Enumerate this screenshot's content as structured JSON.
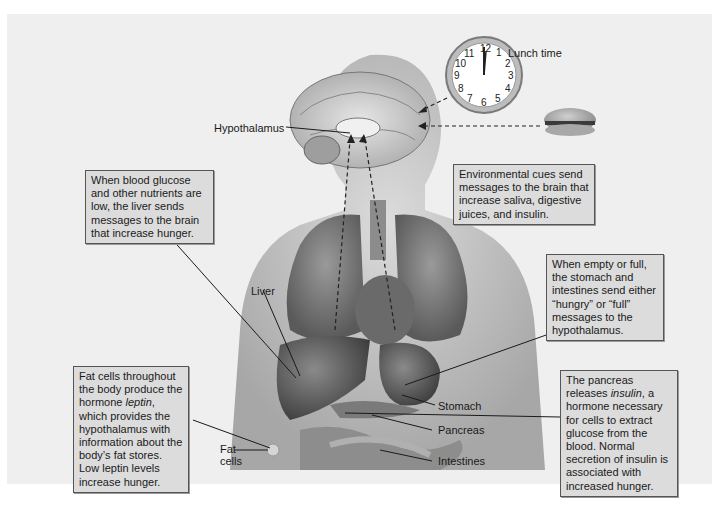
{
  "figure": {
    "title_region": "Regulation of hunger and satiety",
    "clock": {
      "label": "Lunch time",
      "numbers": [
        "12",
        "1",
        "2",
        "3",
        "4",
        "5",
        "6",
        "7",
        "8",
        "9",
        "10",
        "11"
      ],
      "time": "12:00"
    },
    "labels": {
      "hypothalamus": "Hypothalamus",
      "liver": "Liver",
      "stomach": "Stomach",
      "pancreas": "Pancreas",
      "intestines": "Intestines",
      "fat_cells_line1": "Fat",
      "fat_cells_line2": "cells"
    },
    "callouts": {
      "environmental": "Environmental cues send messages to the brain that increase saliva, digestive juices, and insulin.",
      "liver": "When blood glucose and other nutrients are low, the liver sends messages to the brain that increase hunger.",
      "stomach": "When empty or full, the stomach and intestines send either “hungry” or “full” messages to the hypothalamus.",
      "pancreas_pre": "The pancreas releases ",
      "pancreas_italic": "insulin",
      "pancreas_post": ", a hormone necessary for cells to extract glucose from the blood. Normal secretion of insulin is associated with increased hunger.",
      "fat_pre": "Fat cells throughout the body produce the hormone ",
      "fat_italic": "leptin",
      "fat_post": ", which provides the hypothalamus with information about the body’s fat stores. Low leptin levels increase hunger."
    },
    "colors": {
      "panel_bg": "#efefef",
      "box_bg": "#dcdcdc",
      "box_border": "#555555",
      "leader_line": "#1a1a1a"
    }
  }
}
